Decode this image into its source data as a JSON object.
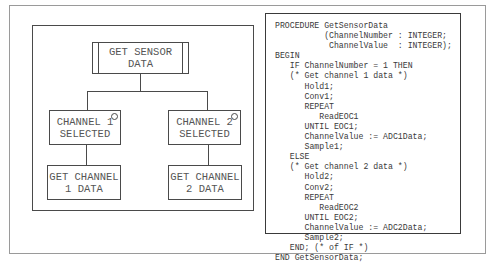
{
  "diagram": {
    "root": {
      "label": "GET SENSOR\nDATA",
      "type": "library-module"
    },
    "branches": [
      {
        "condition": {
          "label": "CHANNEL 1\nSELECTED",
          "selection_marker": "circle"
        },
        "action": {
          "label": "GET CHANNEL\n1 DATA"
        }
      },
      {
        "condition": {
          "label": "CHANNEL 2\nSELECTED",
          "selection_marker": "circle"
        },
        "action": {
          "label": "GET CHANNEL\n2 DATA"
        }
      }
    ]
  },
  "code": {
    "language": "Modula-2",
    "lines": [
      "PROCEDURE GetSensorData",
      "          (ChannelNumber : INTEGER;",
      "           ChannelValue  : INTEGER);",
      "BEGIN",
      "   IF ChannelNumber = 1 THEN",
      "   (* Get channel 1 data *)",
      "      Hold1;",
      "      Conv1;",
      "      REPEAT",
      "         ReadEOC1",
      "      UNTIL EOC1;",
      "      ChannelValue := ADC1Data;",
      "      Sample1;",
      "   ELSE",
      "   (* Get channel 2 data *)",
      "      Hold2;",
      "      Conv2;",
      "      REPEAT",
      "         ReadEOC2",
      "      UNTIL EOC2;",
      "      ChannelValue := ADC2Data;",
      "      Sample2;",
      "   END; (* of IF *)",
      "END GetSensorData;"
    ]
  }
}
